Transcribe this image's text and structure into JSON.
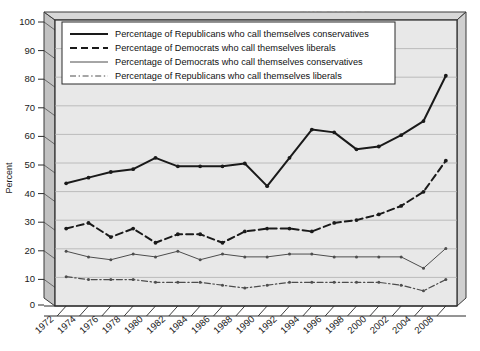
{
  "chart_data": {
    "type": "line",
    "title": "",
    "xlabel": "",
    "ylabel": "Percent",
    "ylim": [
      0,
      100
    ],
    "ytick_step": 10,
    "yticks": [
      "0",
      "10",
      "20",
      "30",
      "40",
      "50",
      "60",
      "70",
      "80",
      "90",
      "100"
    ],
    "grid": true,
    "grid_axis": "y",
    "legend_position": "top-left-inside",
    "x": [
      1972,
      1974,
      1976,
      1978,
      1980,
      1982,
      1984,
      1986,
      1988,
      1990,
      1992,
      1994,
      1996,
      1998,
      2000,
      2002,
      2004,
      2008
    ],
    "categories": [
      "1972",
      "1974",
      "1976",
      "1978",
      "1980",
      "1982",
      "1984",
      "1986",
      "1988",
      "1990",
      "1992",
      "1994",
      "1996",
      "1998",
      "2000",
      "2002",
      "2004",
      "2008"
    ],
    "series": [
      {
        "name": "Percentage of Republicans who call themselves conservatives",
        "style": "solid",
        "color": "#1a1a1a",
        "width": 2.0,
        "marker": "dot",
        "values": [
          43,
          45,
          47,
          48,
          52,
          49,
          49,
          49,
          50,
          42,
          52,
          62,
          61,
          55,
          56,
          60,
          65,
          81
        ]
      },
      {
        "name": "Percentage of Democrats who call themselves liberals",
        "style": "dashed",
        "color": "#1a1a1a",
        "width": 2.0,
        "marker": "dot",
        "values": [
          27,
          29,
          24,
          27,
          22,
          25,
          25,
          22,
          26,
          27,
          27,
          26,
          29,
          30,
          32,
          35,
          40,
          51
        ]
      },
      {
        "name": "Percentage of Democrats who call themselves conservatives",
        "style": "solid",
        "color": "#4d4d4d",
        "width": 1.0,
        "marker": "dot",
        "values": [
          19,
          17,
          16,
          18,
          17,
          19,
          16,
          18,
          17,
          17,
          18,
          18,
          17,
          17,
          17,
          17,
          13,
          20
        ]
      },
      {
        "name": "Percentage of Republicans who call themselves liberals",
        "style": "dash-dot",
        "color": "#4d4d4d",
        "width": 1.2,
        "marker": "dot",
        "values": [
          10,
          9,
          9,
          9,
          8,
          8,
          8,
          7,
          6,
          7,
          8,
          8,
          8,
          8,
          8,
          7,
          5,
          9
        ]
      }
    ]
  },
  "legend": {
    "entries": [
      {
        "label": "Percentage of Republicans who call themselves conservatives",
        "style": "solid",
        "weight": "thick"
      },
      {
        "label": "Percentage of Democrats who call themselves liberals",
        "style": "dashed",
        "weight": "thick"
      },
      {
        "label": "Percentage of Democrats who call themselves conservatives",
        "style": "solid",
        "weight": "thin"
      },
      {
        "label": "Percentage of Republicans who call themselves liberals",
        "style": "dash-dot",
        "weight": "thin"
      }
    ]
  },
  "ghost_text": {
    "lines": [
      "THE RISE OF",
      "POLITICAL POLARIZATION",
      "party identification and ideological self-",
      "among the mass public",
      "conservatives and Democrats",
      "more likely to identify"
    ]
  },
  "colors": {
    "plot_background": "#e8e8e8",
    "frame_side": "#c2c2c2",
    "gridline": "#b5b5b5",
    "axis": "#1a1a1a",
    "series_primary": "#1a1a1a",
    "series_secondary": "#4d4d4d"
  }
}
